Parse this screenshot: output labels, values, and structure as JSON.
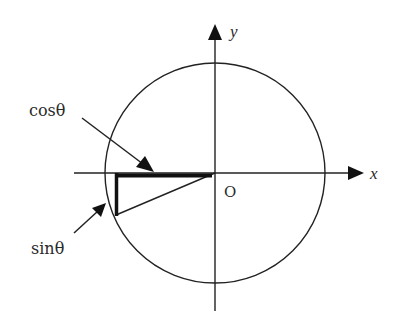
{
  "diagram": {
    "colors": {
      "stroke": "#222222",
      "background": "#ffffff"
    },
    "axes": {
      "x_label": "x",
      "y_label": "y",
      "origin_label": "O"
    },
    "labels": {
      "cos": "cosθ",
      "sin": "sinθ"
    },
    "geometry": {
      "center": [
        215,
        173
      ],
      "radius": 110,
      "point": [
        116,
        215
      ]
    }
  }
}
